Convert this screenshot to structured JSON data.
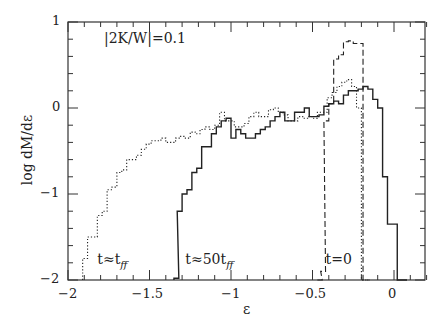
{
  "chart_data": {
    "type": "line",
    "title": "",
    "annotation": "|2K/W|=0.1",
    "xlabel": "ε",
    "ylabel": "log dM/dε",
    "xlim": [
      -2,
      0.2
    ],
    "ylim": [
      -2,
      1
    ],
    "xticks": [
      "-2",
      "-1.5",
      "-1",
      "-0.5",
      "0"
    ],
    "yticks": [
      "1",
      "0",
      "-1",
      "-2"
    ],
    "grid": false,
    "series": [
      {
        "name": "t=0",
        "style": "dashed",
        "x": [
          -0.47,
          -0.45,
          -0.43,
          -0.4,
          -0.37,
          -0.34,
          -0.31,
          -0.28,
          -0.25,
          -0.22,
          -0.19
        ],
        "y": [
          -2.0,
          -1.9,
          -0.15,
          0.05,
          0.57,
          0.62,
          0.77,
          0.78,
          0.75,
          0.75,
          -2.0
        ]
      },
      {
        "name": "t≈t_ff",
        "style": "dotted",
        "x": [
          -1.91,
          -1.88,
          -1.85,
          -1.82,
          -1.79,
          -1.76,
          -1.73,
          -1.7,
          -1.67,
          -1.64,
          -1.61,
          -1.58,
          -1.55,
          -1.52,
          -1.49,
          -1.46,
          -1.43,
          -1.4,
          -1.37,
          -1.34,
          -1.31,
          -1.28,
          -1.25,
          -1.22,
          -1.19,
          -1.16,
          -1.13,
          -1.1,
          -1.07,
          -1.04,
          -1.01,
          -0.98,
          -0.95,
          -0.92,
          -0.89,
          -0.86,
          -0.83,
          -0.8,
          -0.77,
          -0.74,
          -0.71,
          -0.68,
          -0.65,
          -0.62,
          -0.59,
          -0.56,
          -0.53,
          -0.5,
          -0.47,
          -0.44,
          -0.41,
          -0.38,
          -0.35,
          -0.32,
          -0.29,
          -0.26,
          -0.23,
          -0.2,
          -0.17
        ],
        "y": [
          -1.75,
          -1.5,
          -1.5,
          -1.25,
          -1.2,
          -0.95,
          -0.92,
          -0.75,
          -0.72,
          -0.6,
          -0.6,
          -0.55,
          -0.48,
          -0.42,
          -0.38,
          -0.38,
          -0.35,
          -0.4,
          -0.4,
          -0.35,
          -0.33,
          -0.35,
          -0.28,
          -0.3,
          -0.25,
          -0.22,
          -0.25,
          -0.2,
          -0.05,
          -0.15,
          -0.15,
          -0.22,
          -0.22,
          -0.18,
          -0.1,
          -0.05,
          -0.1,
          -0.1,
          -0.02,
          0.0,
          -0.05,
          -0.08,
          -0.15,
          -0.15,
          -0.1,
          -0.12,
          -0.1,
          -0.12,
          -0.05,
          -0.05,
          0.12,
          0.18,
          0.25,
          0.3,
          0.33,
          0.25,
          0.0,
          -2.0,
          -2.0
        ]
      },
      {
        "name": "t≈50t_ff",
        "style": "solid",
        "x": [
          -1.35,
          -1.33,
          -1.3,
          -1.27,
          -1.24,
          -1.21,
          -1.18,
          -1.15,
          -1.12,
          -1.09,
          -1.06,
          -1.03,
          -1.0,
          -0.97,
          -0.94,
          -0.91,
          -0.88,
          -0.85,
          -0.82,
          -0.79,
          -0.76,
          -0.73,
          -0.7,
          -0.67,
          -0.64,
          -0.61,
          -0.58,
          -0.55,
          -0.52,
          -0.49,
          -0.46,
          -0.43,
          -0.4,
          -0.37,
          -0.34,
          -0.31,
          -0.28,
          -0.25,
          -0.22,
          -0.19,
          -0.16,
          -0.13,
          -0.1,
          -0.07,
          -0.04,
          -0.01,
          0.02,
          0.05
        ],
        "y": [
          -1.98,
          -1.2,
          -1.0,
          -0.95,
          -0.75,
          -0.7,
          -0.45,
          -0.45,
          -0.3,
          -0.22,
          -0.15,
          -0.12,
          -0.35,
          -0.25,
          -0.3,
          -0.35,
          -0.35,
          -0.3,
          -0.25,
          -0.22,
          -0.15,
          -0.1,
          -0.05,
          -0.15,
          -0.15,
          -0.05,
          -0.05,
          0.0,
          -0.1,
          -0.1,
          -0.08,
          0.02,
          0.05,
          0.08,
          0.05,
          0.15,
          0.2,
          0.2,
          0.22,
          0.25,
          0.22,
          0.1,
          0.0,
          -0.8,
          -1.35,
          -1.35,
          -2.0,
          -2.0
        ]
      }
    ],
    "labels": [
      {
        "text": "t≈t",
        "sub": "ff",
        "x": -1.82,
        "y": -1.75
      },
      {
        "text": "t≈50t",
        "sub": "ff",
        "x": -1.28,
        "y": -1.75
      },
      {
        "text": "t=0",
        "sub": "",
        "x": -0.42,
        "y": -1.75
      }
    ]
  }
}
